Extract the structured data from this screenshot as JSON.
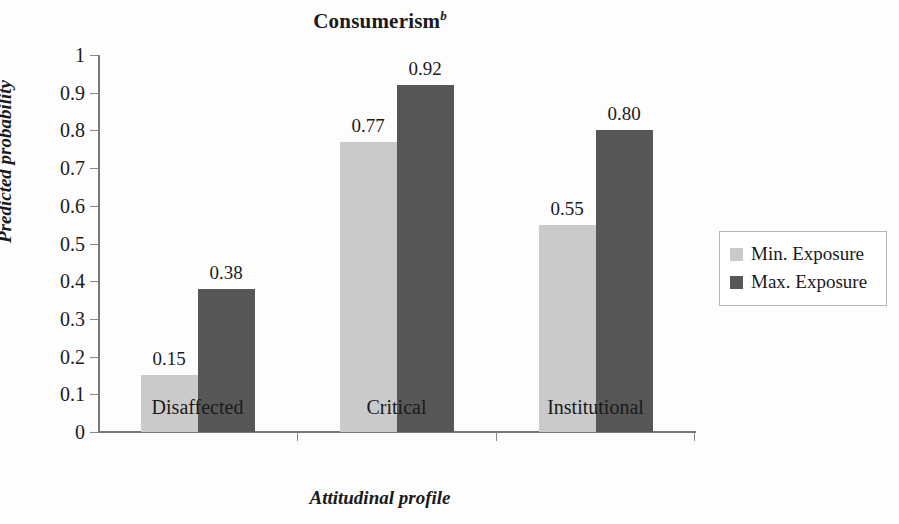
{
  "chart_data": {
    "type": "bar",
    "title": "Consumerism",
    "title_superscript": "b",
    "xlabel": "Attitudinal profile",
    "ylabel": "Predicted probability",
    "ylim": [
      0,
      1
    ],
    "ytick_labels": [
      "1",
      "0.9",
      "0.8",
      "0.7",
      "0.6",
      "0.5",
      "0.4",
      "0.3",
      "0.2",
      "0.1",
      "0"
    ],
    "ytick_values": [
      1,
      0.9,
      0.8,
      0.7,
      0.6,
      0.5,
      0.4,
      0.3,
      0.2,
      0.1,
      0
    ],
    "grid": false,
    "legend_position": "right",
    "categories": [
      "Disaffected",
      "Critical",
      "Institutional"
    ],
    "series": [
      {
        "name": "Min. Exposure",
        "color": "#cacaca",
        "values": [
          0.15,
          0.77,
          0.55
        ],
        "labels": [
          "0.15",
          "0.77",
          "0.55"
        ]
      },
      {
        "name": "Max. Exposure",
        "color": "#575757",
        "values": [
          0.38,
          0.92,
          0.8
        ],
        "labels": [
          "0.38",
          "0.92",
          "0.80"
        ]
      }
    ]
  },
  "legend": {
    "items": [
      {
        "label": "Min. Exposure",
        "color": "#cacaca"
      },
      {
        "label": "Max. Exposure",
        "color": "#575757"
      }
    ]
  },
  "axes": {
    "axis_color": "#777777",
    "tick_color": "#888888"
  }
}
